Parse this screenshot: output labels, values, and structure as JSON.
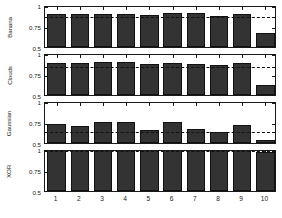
{
  "chart_data": {
    "type": "bar",
    "title": "",
    "xlabel": "",
    "ylabel": "",
    "layout": "4 stacked subplots sharing one x axis",
    "grid": false,
    "legend": false,
    "ylim": [
      0.5,
      1
    ],
    "yticks": [
      0.5,
      0.75,
      1
    ],
    "ytick_labels": [
      "0.5",
      "0.75",
      "1"
    ],
    "categories": [
      "1",
      "2",
      "3",
      "4",
      "5",
      "6",
      "7",
      "8",
      "9",
      "10"
    ],
    "xtick_labels": [
      "1",
      "2",
      "3",
      "4",
      "5",
      "6",
      "7",
      "8",
      "9",
      "10"
    ],
    "bar_color": "#333333",
    "refline_color": "#111111",
    "panels": [
      {
        "name": "Banana",
        "label": "Banana",
        "values": [
          0.89,
          0.89,
          0.89,
          0.89,
          0.885,
          0.9,
          0.9,
          0.875,
          0.895,
          0.67
        ],
        "refline": 0.885
      },
      {
        "name": "Clouds",
        "label": "Clouds",
        "values": [
          0.885,
          0.88,
          0.89,
          0.89,
          0.865,
          0.885,
          0.875,
          0.855,
          0.885,
          0.615
        ],
        "refline": 0.862
      },
      {
        "name": "Gaussian",
        "label": "Gaussian",
        "values": [
          0.725,
          0.705,
          0.755,
          0.755,
          0.66,
          0.745,
          0.665,
          0.635,
          0.72,
          0.53
        ],
        "refline": 0.655
      },
      {
        "name": "XOR",
        "label": "XOR",
        "values": [
          1.0,
          1.0,
          1.0,
          1.0,
          1.0,
          1.0,
          1.0,
          1.0,
          1.0,
          0.965
        ],
        "refline": 1.0
      }
    ]
  }
}
